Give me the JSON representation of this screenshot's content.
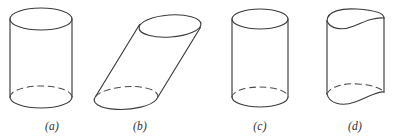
{
  "figure": {
    "background_color": "#ffffff",
    "stroke_color": "#3b3b3b",
    "dashed_stroke_color": "#4a4a4a",
    "caption_color": "#2e2e2e",
    "panels": [
      {
        "id": "panel-a",
        "label": "(a)",
        "shape_name": "right-circular-cylinder",
        "label_x": 52,
        "label_y": 130,
        "top_ellipse": {
          "cx": 41,
          "cy": 19,
          "rx": 31,
          "ry": 11
        },
        "bottom_ellipse": {
          "cx": 41,
          "cy": 97,
          "rx": 31,
          "ry": 11
        },
        "left_wall_x": 10,
        "right_wall_x": 72,
        "top_y": 19,
        "bottom_y": 97
      },
      {
        "id": "panel-b",
        "label": "(b)",
        "shape_name": "oblique-circular-cylinder",
        "label_x": 140,
        "label_y": 130,
        "top_ellipse": {
          "cx": 170,
          "cy": 26,
          "rx": 31,
          "ry": 11,
          "tilt": -8
        },
        "bottom_ellipse": {
          "cx": 126,
          "cy": 98,
          "rx": 31,
          "ry": 11,
          "tilt": -8
        },
        "slant_dx": 44,
        "slant_dy": -72
      },
      {
        "id": "panel-c",
        "label": "(c)",
        "shape_name": "narrow-right-cylinder",
        "label_x": 260,
        "label_y": 130,
        "top_ellipse": {
          "cx": 260,
          "cy": 19,
          "rx": 28,
          "ry": 10
        },
        "bottom_ellipse": {
          "cx": 260,
          "cy": 97,
          "rx": 28,
          "ry": 10
        },
        "left_wall_x": 232,
        "right_wall_x": 288,
        "top_y": 19,
        "bottom_y": 97
      },
      {
        "id": "panel-d",
        "label": "(d)",
        "shape_name": "wavy-cross-section-cylinder",
        "label_x": 355,
        "label_y": 130,
        "top_curve_center": {
          "cx": 355,
          "cy": 20
        },
        "bottom_curve_center": {
          "cx": 355,
          "cy": 97
        },
        "left_wall_x": 327,
        "right_wall_x": 384,
        "top_y": 20,
        "bottom_y": 97
      }
    ]
  }
}
